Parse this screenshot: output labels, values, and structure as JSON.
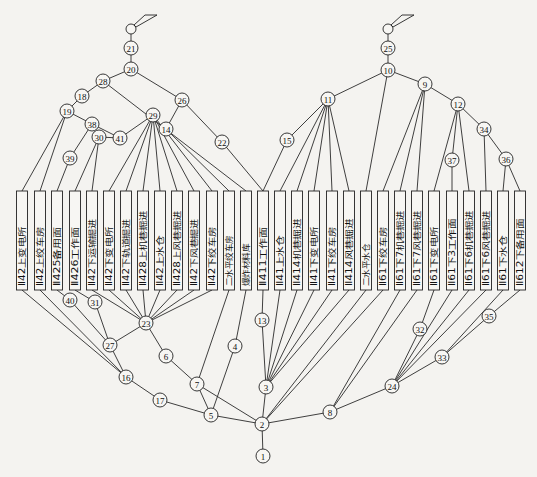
{
  "diagram": {
    "type": "ventilation-network-graph",
    "node_color": "#222222",
    "background": "#f4f3f0",
    "inlets": [
      {
        "id": "inlet-left",
        "x": 189,
        "y": 29
      },
      {
        "id": "inlet-right",
        "x": 395,
        "y": 29
      }
    ],
    "nodes": [
      {
        "id": "1",
        "x": 263,
        "y": 456
      },
      {
        "id": "2",
        "x": 262,
        "y": 424
      },
      {
        "id": "3",
        "x": 266,
        "y": 387
      },
      {
        "id": "4",
        "x": 235,
        "y": 346
      },
      {
        "id": "5",
        "x": 211,
        "y": 415
      },
      {
        "id": "6",
        "x": 166,
        "y": 356
      },
      {
        "id": "7",
        "x": 197,
        "y": 384
      },
      {
        "id": "8",
        "x": 330,
        "y": 412
      },
      {
        "id": "9",
        "x": 425,
        "y": 84
      },
      {
        "id": "10",
        "x": 388,
        "y": 70
      },
      {
        "id": "11",
        "x": 328,
        "y": 99
      },
      {
        "id": "12",
        "x": 458,
        "y": 104
      },
      {
        "id": "13",
        "x": 262,
        "y": 320
      },
      {
        "id": "14",
        "x": 166,
        "y": 129
      },
      {
        "id": "15",
        "x": 287,
        "y": 140
      },
      {
        "id": "16",
        "x": 126,
        "y": 377
      },
      {
        "id": "17",
        "x": 160,
        "y": 400
      },
      {
        "id": "18",
        "x": 82,
        "y": 96
      },
      {
        "id": "19",
        "x": 67,
        "y": 111
      },
      {
        "id": "20",
        "x": 131,
        "y": 69
      },
      {
        "id": "21",
        "x": 131,
        "y": 48
      },
      {
        "id": "22",
        "x": 222,
        "y": 142
      },
      {
        "id": "23",
        "x": 146,
        "y": 323
      },
      {
        "id": "24",
        "x": 392,
        "y": 386
      },
      {
        "id": "25",
        "x": 388,
        "y": 48
      },
      {
        "id": "26",
        "x": 182,
        "y": 100
      },
      {
        "id": "27",
        "x": 110,
        "y": 345
      },
      {
        "id": "28",
        "x": 103,
        "y": 81
      },
      {
        "id": "29",
        "x": 153,
        "y": 115
      },
      {
        "id": "30",
        "x": 99,
        "y": 137
      },
      {
        "id": "31",
        "x": 95,
        "y": 302
      },
      {
        "id": "32",
        "x": 420,
        "y": 329
      },
      {
        "id": "33",
        "x": 442,
        "y": 357
      },
      {
        "id": "34",
        "x": 484,
        "y": 129
      },
      {
        "id": "35",
        "x": 489,
        "y": 316
      },
      {
        "id": "36",
        "x": 506,
        "y": 159
      },
      {
        "id": "37",
        "x": 452,
        "y": 160
      },
      {
        "id": "38",
        "x": 92,
        "y": 124
      },
      {
        "id": "39",
        "x": 70,
        "y": 158
      },
      {
        "id": "40",
        "x": 70,
        "y": 300
      },
      {
        "id": "41",
        "x": 120,
        "y": 138
      }
    ],
    "workplaces": [
      {
        "label": "Ⅱ42上变电所",
        "x": 22
      },
      {
        "label": "Ⅱ42上绞车房",
        "x": 40
      },
      {
        "label": "Ⅱ425备用面",
        "x": 57
      },
      {
        "label": "Ⅱ426工作面",
        "x": 75
      },
      {
        "label": "Ⅱ42下运输掘进",
        "x": 92
      },
      {
        "label": "Ⅱ42下变电所",
        "x": 109
      },
      {
        "label": "Ⅱ42下轨道掘进",
        "x": 126
      },
      {
        "label": "Ⅱ428上机巷掘进",
        "x": 143
      },
      {
        "label": "Ⅱ42上水仓",
        "x": 160
      },
      {
        "label": "Ⅱ428上风巷掘进",
        "x": 177
      },
      {
        "label": "Ⅱ42下风巷掘进",
        "x": 194
      },
      {
        "label": "Ⅱ42下绞车房",
        "x": 212
      },
      {
        "label": "二水平绞车房",
        "x": 229
      },
      {
        "label": "爆炸材料库",
        "x": 246
      },
      {
        "label": "Ⅱ411工作面",
        "x": 263
      },
      {
        "label": "Ⅱ41上水仓",
        "x": 280
      },
      {
        "label": "Ⅱ414机巷掘进",
        "x": 297
      },
      {
        "label": "Ⅱ41下变电所",
        "x": 314
      },
      {
        "label": "Ⅱ41下绞车房",
        "x": 332
      },
      {
        "label": "Ⅱ414风巷掘进",
        "x": 349
      },
      {
        "label": "二水平水仓",
        "x": 366
      },
      {
        "label": "Ⅱ61下绞车房",
        "x": 383
      },
      {
        "label": "Ⅱ61下7机巷掘进",
        "x": 400
      },
      {
        "label": "Ⅱ61下7风巷掘进",
        "x": 417
      },
      {
        "label": "Ⅱ61下变电所",
        "x": 434
      },
      {
        "label": "Ⅱ61下3工作面",
        "x": 452
      },
      {
        "label": "Ⅱ61下6机巷掘进",
        "x": 469
      },
      {
        "label": "Ⅱ61下6风巷掘进",
        "x": 486
      },
      {
        "label": "Ⅱ61下水仓",
        "x": 503
      },
      {
        "label": "Ⅱ612下备用面",
        "x": 520
      }
    ],
    "edges_top": [
      [
        "21",
        "20"
      ],
      [
        "20",
        "28"
      ],
      [
        "20",
        "26"
      ],
      [
        "28",
        "18"
      ],
      [
        "28",
        "W13"
      ],
      [
        "18",
        "19"
      ],
      [
        "19",
        "38"
      ],
      [
        "19",
        "W0"
      ],
      [
        "19",
        "W1"
      ],
      [
        "38",
        "39"
      ],
      [
        "38",
        "41"
      ],
      [
        "39",
        "W2"
      ],
      [
        "41",
        "30"
      ],
      [
        "41",
        "29"
      ],
      [
        "30",
        "W3"
      ],
      [
        "30",
        "W4"
      ],
      [
        "29",
        "W5"
      ],
      [
        "29",
        "W6"
      ],
      [
        "29",
        "W7"
      ],
      [
        "29",
        "W8"
      ],
      [
        "29",
        "W9"
      ],
      [
        "29",
        "W10"
      ],
      [
        "29",
        "W11"
      ],
      [
        "26",
        "14"
      ],
      [
        "26",
        "22"
      ],
      [
        "14",
        "W12"
      ],
      [
        "22",
        "W14"
      ],
      [
        "25",
        "10"
      ],
      [
        "10",
        "11"
      ],
      [
        "10",
        "9"
      ],
      [
        "10",
        "W20"
      ],
      [
        "11",
        "15"
      ],
      [
        "15",
        "W14"
      ],
      [
        "11",
        "W15"
      ],
      [
        "11",
        "W16"
      ],
      [
        "11",
        "W17"
      ],
      [
        "11",
        "W18"
      ],
      [
        "11",
        "W19"
      ],
      [
        "9",
        "W21"
      ],
      [
        "9",
        "W22"
      ],
      [
        "9",
        "W23"
      ],
      [
        "9",
        "12"
      ],
      [
        "12",
        "37"
      ],
      [
        "37",
        "W25"
      ],
      [
        "12",
        "W24"
      ],
      [
        "12",
        "W26"
      ],
      [
        "12",
        "34"
      ],
      [
        "34",
        "W27"
      ],
      [
        "34",
        "36"
      ],
      [
        "36",
        "W28"
      ],
      [
        "36",
        "W29"
      ]
    ],
    "edges_bottom": [
      [
        "W0",
        "16"
      ],
      [
        "W1",
        "16"
      ],
      [
        "W2",
        "40"
      ],
      [
        "40",
        "27"
      ],
      [
        "W3",
        "31"
      ],
      [
        "31",
        "27"
      ],
      [
        "27",
        "16"
      ],
      [
        "27",
        "23"
      ],
      [
        "W4",
        "23"
      ],
      [
        "W5",
        "23"
      ],
      [
        "W6",
        "23"
      ],
      [
        "W7",
        "23"
      ],
      [
        "W8",
        "23"
      ],
      [
        "W9",
        "23"
      ],
      [
        "W10",
        "23"
      ],
      [
        "W11",
        "23"
      ],
      [
        "23",
        "6"
      ],
      [
        "6",
        "7"
      ],
      [
        "W12",
        "7"
      ],
      [
        "W13",
        "4"
      ],
      [
        "4",
        "5"
      ],
      [
        "7",
        "5"
      ],
      [
        "7",
        "2"
      ],
      [
        "16",
        "17"
      ],
      [
        "17",
        "5"
      ],
      [
        "5",
        "2"
      ],
      [
        "W14",
        "13"
      ],
      [
        "13",
        "3"
      ],
      [
        "W15",
        "3"
      ],
      [
        "W16",
        "3"
      ],
      [
        "W17",
        "3"
      ],
      [
        "W18",
        "3"
      ],
      [
        "W19",
        "3"
      ],
      [
        "3",
        "2"
      ],
      [
        "W20",
        "2"
      ],
      [
        "W21",
        "2"
      ],
      [
        "W22",
        "8"
      ],
      [
        "W23",
        "8"
      ],
      [
        "8",
        "2"
      ],
      [
        "W24",
        "32"
      ],
      [
        "32",
        "24"
      ],
      [
        "W25",
        "24"
      ],
      [
        "W26",
        "24"
      ],
      [
        "W27",
        "24"
      ],
      [
        "W28",
        "33"
      ],
      [
        "W29",
        "35"
      ],
      [
        "35",
        "33"
      ],
      [
        "33",
        "24"
      ],
      [
        "24",
        "8"
      ],
      [
        "2",
        "1"
      ]
    ]
  }
}
